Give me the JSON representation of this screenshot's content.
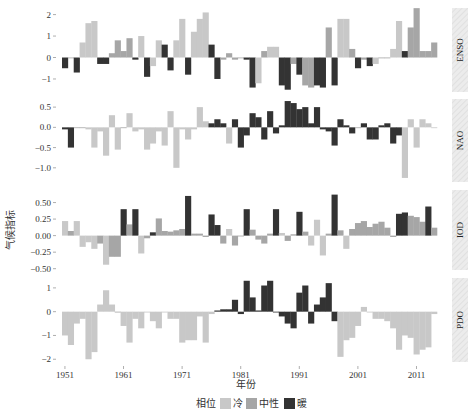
{
  "chart_data": {
    "type": "bar",
    "title": "",
    "xlabel": "年份",
    "ylabel": "气候指标",
    "x_ticks": [
      "1951",
      "1961",
      "1971",
      "1981",
      "1991",
      "2001",
      "2011"
    ],
    "x_range": [
      1951,
      2014
    ],
    "legend": {
      "title": "相位",
      "entries": [
        {
          "label": "冷",
          "color": "#c8c8c8"
        },
        {
          "label": "中性",
          "color": "#a6a6a6"
        },
        {
          "label": "暖",
          "color": "#333333"
        }
      ],
      "position": "bottom"
    },
    "grid": false,
    "panels": [
      {
        "name": "ENSO",
        "y_ticks": [
          "2",
          "1",
          "0",
          "-1"
        ],
        "y_tick_values": [
          2,
          1,
          0,
          -1
        ],
        "ylim": [
          -1.7,
          2.4
        ],
        "years": [
          1951,
          1952,
          1953,
          1954,
          1955,
          1956,
          1957,
          1958,
          1959,
          1960,
          1961,
          1962,
          1963,
          1964,
          1965,
          1966,
          1967,
          1968,
          1969,
          1970,
          1971,
          1972,
          1973,
          1974,
          1975,
          1976,
          1977,
          1978,
          1979,
          1980,
          1981,
          1982,
          1983,
          1984,
          1985,
          1986,
          1987,
          1988,
          1989,
          1990,
          1991,
          1992,
          1993,
          1994,
          1995,
          1996,
          1997,
          1998,
          1999,
          2000,
          2001,
          2002,
          2003,
          2004,
          2005,
          2006,
          2007,
          2008,
          2009,
          2010,
          2011,
          2012,
          2013,
          2014
        ],
        "values": [
          -0.5,
          0,
          -0.7,
          0.7,
          1.6,
          1.7,
          -0.3,
          -0.3,
          0.2,
          0.8,
          0.3,
          0.9,
          -0.1,
          1.0,
          -0.9,
          -0.4,
          0.8,
          0.6,
          -0.6,
          0.8,
          1.8,
          -0.8,
          1.2,
          1.8,
          2.1,
          0.6,
          -1.0,
          -0.1,
          0.2,
          -0.1,
          0,
          -0.1,
          -1.4,
          -1.2,
          0.3,
          0.5,
          0.5,
          -1.3,
          -1.5,
          -0.3,
          -0.8,
          -1.3,
          -1.4,
          -1.3,
          -1.4,
          1.4,
          -1.3,
          1.8,
          1.8,
          0.4,
          -0.5,
          -0.1,
          -0.4,
          -0.3,
          0,
          0,
          0.4,
          1.7,
          0.3,
          1.4,
          2.3,
          0.3,
          0.3,
          0.7
        ],
        "phases": [
          "warm",
          "neutral",
          "warm",
          "cold",
          "cold",
          "cold",
          "warm",
          "warm",
          "neutral",
          "neutral",
          "neutral",
          "neutral",
          "warm",
          "cold",
          "warm",
          "cold",
          "cold",
          "warm",
          "warm",
          "cold",
          "cold",
          "warm",
          "cold",
          "cold",
          "cold",
          "warm",
          "warm",
          "neutral",
          "neutral",
          "neutral",
          "neutral",
          "warm",
          "warm",
          "cold",
          "neutral",
          "cold",
          "cold",
          "warm",
          "warm",
          "neutral",
          "warm",
          "neutral",
          "neutral",
          "warm",
          "warm",
          "neutral",
          "warm",
          "cold",
          "cold",
          "neutral",
          "warm",
          "neutral",
          "warm",
          "cold",
          "neutral",
          "neutral",
          "cold",
          "cold",
          "warm",
          "neutral",
          "neutral",
          "neutral",
          "neutral",
          "neutral"
        ]
      },
      {
        "name": "NAO",
        "y_ticks": [
          "0.5",
          "0.0",
          "-0.5",
          "-1.0"
        ],
        "y_tick_values": [
          0.5,
          0.0,
          -0.5,
          -1.0
        ],
        "ylim": [
          -1.4,
          0.75
        ],
        "years": [
          1951,
          1952,
          1953,
          1954,
          1955,
          1956,
          1957,
          1958,
          1959,
          1960,
          1961,
          1962,
          1963,
          1964,
          1965,
          1966,
          1967,
          1968,
          1969,
          1970,
          1971,
          1972,
          1973,
          1974,
          1975,
          1976,
          1977,
          1978,
          1979,
          1980,
          1981,
          1982,
          1983,
          1984,
          1985,
          1986,
          1987,
          1988,
          1989,
          1990,
          1991,
          1992,
          1993,
          1994,
          1995,
          1996,
          1997,
          1998,
          1999,
          2000,
          2001,
          2002,
          2003,
          2004,
          2005,
          2006,
          2007,
          2008,
          2009,
          2010,
          2011,
          2012,
          2013,
          2014
        ],
        "values": [
          -0.05,
          -0.5,
          0,
          0,
          -0.05,
          -0.5,
          -0.1,
          -0.7,
          0.3,
          -0.55,
          0,
          0.35,
          -0.1,
          -0.05,
          -0.55,
          -0.4,
          -0.1,
          -0.45,
          0.4,
          -1.0,
          -0.05,
          -0.3,
          -0.05,
          0.5,
          0.15,
          0.1,
          0.2,
          0.1,
          -0.4,
          0.2,
          -0.5,
          -0.2,
          0.35,
          0.25,
          -0.3,
          0.4,
          -0.15,
          0.05,
          0.65,
          0.6,
          0.45,
          0.5,
          0.1,
          0.5,
          -0.05,
          -0.1,
          -0.45,
          0.2,
          0.05,
          -0.15,
          0,
          0.1,
          -0.3,
          -0.3,
          0.05,
          0.1,
          -0.4,
          -0.2,
          -1.25,
          0.2,
          -0.5,
          0.2,
          0.1,
          0
        ],
        "phases": [
          "warm",
          "warm",
          "neutral",
          "neutral",
          "cold",
          "cold",
          "cold",
          "cold",
          "cold",
          "cold",
          "neutral",
          "cold",
          "cold",
          "cold",
          "cold",
          "cold",
          "cold",
          "cold",
          "cold",
          "cold",
          "cold",
          "cold",
          "cold",
          "cold",
          "cold",
          "warm",
          "warm",
          "warm",
          "cold",
          "warm",
          "warm",
          "warm",
          "warm",
          "warm",
          "warm",
          "warm",
          "warm",
          "warm",
          "warm",
          "warm",
          "warm",
          "warm",
          "warm",
          "warm",
          "warm",
          "warm",
          "warm",
          "warm",
          "warm",
          "warm",
          "neutral",
          "warm",
          "warm",
          "warm",
          "warm",
          "warm",
          "warm",
          "warm",
          "cold",
          "cold",
          "cold",
          "cold",
          "cold",
          "cold"
        ]
      },
      {
        "name": "IOD",
        "y_ticks": [
          "0.50",
          "0.25",
          "0.00",
          "-0.25",
          "-0.50"
        ],
        "y_tick_values": [
          0.5,
          0.25,
          0.0,
          -0.25,
          -0.5
        ],
        "ylim": [
          -0.55,
          0.72
        ],
        "years": [
          1951,
          1952,
          1953,
          1954,
          1955,
          1956,
          1957,
          1958,
          1959,
          1960,
          1961,
          1962,
          1963,
          1964,
          1965,
          1966,
          1967,
          1968,
          1969,
          1970,
          1971,
          1972,
          1973,
          1974,
          1975,
          1976,
          1977,
          1978,
          1979,
          1980,
          1981,
          1982,
          1983,
          1984,
          1985,
          1986,
          1987,
          1988,
          1989,
          1990,
          1991,
          1992,
          1993,
          1994,
          1995,
          1996,
          1997,
          1998,
          1999,
          2000,
          2001,
          2002,
          2003,
          2004,
          2005,
          2006,
          2007,
          2008,
          2009,
          2010,
          2011,
          2012,
          2013,
          2014
        ],
        "values": [
          0.22,
          0.07,
          0.22,
          -0.17,
          -0.1,
          -0.2,
          -0.12,
          -0.44,
          -0.32,
          -0.32,
          0.4,
          0.17,
          0.4,
          -0.27,
          -0.04,
          0.05,
          0.26,
          0.07,
          0.06,
          0.08,
          0.1,
          0.6,
          0.03,
          0.03,
          -0.02,
          0.32,
          0.16,
          -0.12,
          0.1,
          -0.15,
          -0.01,
          0.4,
          0.09,
          -0.06,
          -0.12,
          0.03,
          0.4,
          0.04,
          -0.08,
          0.02,
          0.36,
          0.06,
          -0.15,
          0.24,
          -0.3,
          0.03,
          0.62,
          0.08,
          -0.2,
          0.1,
          0.19,
          0.22,
          0.13,
          0.18,
          0.21,
          0.12,
          -0.02,
          0.33,
          0.35,
          0.3,
          0.28,
          0.21,
          0.44,
          0.12
        ],
        "phases": [
          "cold",
          "neutral",
          "cold",
          "cold",
          "cold",
          "cold",
          "neutral",
          "cold",
          "neutral",
          "neutral",
          "warm",
          "neutral",
          "warm",
          "cold",
          "neutral",
          "warm",
          "neutral",
          "neutral",
          "neutral",
          "neutral",
          "neutral",
          "warm",
          "neutral",
          "neutral",
          "neutral",
          "warm",
          "warm",
          "neutral",
          "cold",
          "neutral",
          "neutral",
          "warm",
          "neutral",
          "neutral",
          "neutral",
          "neutral",
          "warm",
          "cold",
          "neutral",
          "neutral",
          "warm",
          "neutral",
          "cold",
          "cold",
          "cold",
          "neutral",
          "warm",
          "neutral",
          "cold",
          "neutral",
          "neutral",
          "neutral",
          "neutral",
          "neutral",
          "neutral",
          "neutral",
          "neutral",
          "warm",
          "warm",
          "neutral",
          "neutral",
          "neutral",
          "warm",
          "neutral"
        ]
      },
      {
        "name": "PDO",
        "y_ticks": [
          "1",
          "0",
          "-1",
          "-2"
        ],
        "y_tick_values": [
          1,
          0,
          -1,
          -2
        ],
        "ylim": [
          -2.2,
          1.5
        ],
        "years": [
          1951,
          1952,
          1953,
          1954,
          1955,
          1956,
          1957,
          1958,
          1959,
          1960,
          1961,
          1962,
          1963,
          1964,
          1965,
          1966,
          1967,
          1968,
          1969,
          1970,
          1971,
          1972,
          1973,
          1974,
          1975,
          1976,
          1977,
          1978,
          1979,
          1980,
          1981,
          1982,
          1983,
          1984,
          1985,
          1986,
          1987,
          1988,
          1989,
          1990,
          1991,
          1992,
          1993,
          1994,
          1995,
          1996,
          1997,
          1998,
          1999,
          2000,
          2001,
          2002,
          2003,
          2004,
          2005,
          2006,
          2007,
          2008,
          2009,
          2010,
          2011,
          2012,
          2013,
          2014
        ],
        "values": [
          -1.0,
          -1.4,
          -0.5,
          -0.3,
          -2.0,
          -1.7,
          0.3,
          0.9,
          0.3,
          0,
          -0.6,
          -1.3,
          -0.3,
          -0.7,
          0,
          -0.4,
          -0.7,
          0,
          -0.3,
          -0.3,
          -1.3,
          -1.2,
          -1.2,
          -0.2,
          -1.3,
          -0.1,
          0.05,
          0.1,
          0.1,
          0.5,
          -0.1,
          1.3,
          0.6,
          0.05,
          1.1,
          1.3,
          0,
          -0.2,
          -0.5,
          -0.7,
          0.8,
          1.1,
          -0.5,
          0.3,
          0.6,
          1.2,
          -0.4,
          -1.9,
          -1.2,
          -1.1,
          -0.6,
          0.2,
          0,
          -0.3,
          -0.3,
          -0.4,
          -0.7,
          -1.6,
          -1.0,
          -1.1,
          -1.8,
          -1.6,
          -1.5,
          -0.1
        ],
        "phases": [
          "cold",
          "cold",
          "cold",
          "cold",
          "cold",
          "cold",
          "cold",
          "cold",
          "cold",
          "neutral",
          "cold",
          "cold",
          "cold",
          "cold",
          "cold",
          "cold",
          "cold",
          "cold",
          "cold",
          "cold",
          "cold",
          "cold",
          "cold",
          "cold",
          "cold",
          "cold",
          "warm",
          "warm",
          "warm",
          "warm",
          "warm",
          "warm",
          "warm",
          "warm",
          "warm",
          "warm",
          "warm",
          "warm",
          "warm",
          "warm",
          "warm",
          "warm",
          "warm",
          "warm",
          "warm",
          "warm",
          "warm",
          "cold",
          "cold",
          "cold",
          "cold",
          "cold",
          "cold",
          "cold",
          "cold",
          "cold",
          "cold",
          "cold",
          "cold",
          "cold",
          "cold",
          "cold",
          "cold",
          "cold"
        ]
      }
    ]
  },
  "axes": {
    "xlabel": "年份",
    "ylabel": "气候指标"
  },
  "legend": {
    "title": "相位",
    "cold": "冷",
    "neutral": "中性",
    "warm": "暖"
  },
  "colors": {
    "cold": "#c8c8c8",
    "neutral": "#a6a6a6",
    "warm": "#333333",
    "strip": "#e6e6e6"
  }
}
